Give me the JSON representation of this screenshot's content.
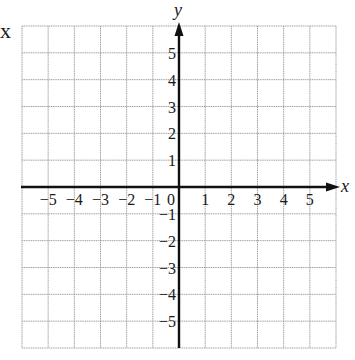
{
  "diagram": {
    "type": "coordinate-grid",
    "x_axis_label": "x",
    "y_axis_label": "y",
    "stray_left_label": "x",
    "x_range": [
      -6,
      6
    ],
    "y_range": [
      -6,
      6
    ],
    "x_tick_labels": [
      "−5",
      "−4",
      "−3",
      "−2",
      "−1",
      "0",
      "1",
      "2",
      "3",
      "4",
      "5"
    ],
    "y_tick_labels_positive": [
      "5",
      "4",
      "3",
      "2",
      "1"
    ],
    "y_tick_labels_negative": [
      "−1",
      "−2",
      "−3",
      "−4",
      "−5"
    ],
    "grid_color": "#9a9a9a",
    "axis_color": "#111111"
  }
}
